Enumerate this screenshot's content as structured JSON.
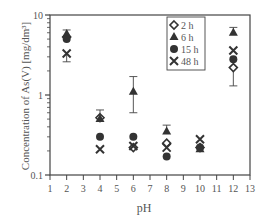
{
  "chart_data": {
    "type": "scatter",
    "title": "",
    "xlabel": "pH",
    "ylabel": "Concentration of As(V) [mg/dm³]",
    "xlim": [
      1,
      13
    ],
    "ylim": [
      0.1,
      10
    ],
    "yscale": "log",
    "x_ticks": [
      "1",
      "2",
      "3",
      "4",
      "5",
      "6",
      "7",
      "8",
      "9",
      "10",
      "11",
      "12",
      "13"
    ],
    "y_ticks": [
      "0.1",
      "1",
      "10"
    ],
    "grid": false,
    "legend_position": "upper-right-inside",
    "x": [
      2,
      4,
      6,
      8,
      10,
      12
    ],
    "series": [
      {
        "name": "2 h",
        "marker": "open-diamond",
        "values": [
          5.3,
          0.52,
          0.22,
          0.25,
          0.22,
          2.2
        ],
        "err_low": [
          null,
          null,
          null,
          null,
          null,
          1.3
        ],
        "err_high": [
          null,
          null,
          null,
          null,
          null,
          null
        ]
      },
      {
        "name": "6 h",
        "marker": "filled-triangle",
        "values": [
          5.8,
          0.5,
          1.1,
          0.35,
          0.21,
          6.0
        ],
        "err_low": [
          null,
          null,
          0.6,
          null,
          null,
          null
        ],
        "err_high": [
          6.5,
          0.65,
          1.7,
          0.42,
          null,
          7.0
        ]
      },
      {
        "name": "15 h",
        "marker": "filled-circle",
        "values": [
          5.0,
          0.3,
          0.3,
          0.17,
          0.22,
          2.8
        ]
      },
      {
        "name": "48 h",
        "marker": "x-cross",
        "values": [
          3.3,
          0.21,
          0.23,
          0.22,
          0.28,
          3.6
        ],
        "err_low": [
          2.6,
          null,
          null,
          null,
          null,
          null
        ],
        "err_high": [
          null,
          null,
          null,
          null,
          null,
          null
        ]
      }
    ]
  },
  "legend": {
    "items": [
      {
        "label": "2 h"
      },
      {
        "label": "6 h"
      },
      {
        "label": "15 h"
      },
      {
        "label": "48 h"
      }
    ]
  },
  "axes": {
    "xlabel": "pH",
    "ylabel": "Concentration of As(V) [mg/dm³]",
    "y_tick_labels": [
      "10",
      "1",
      "0.1"
    ],
    "x_tick_labels": [
      "1",
      "2",
      "3",
      "4",
      "5",
      "6",
      "7",
      "8",
      "9",
      "10",
      "11",
      "12",
      "13"
    ]
  }
}
